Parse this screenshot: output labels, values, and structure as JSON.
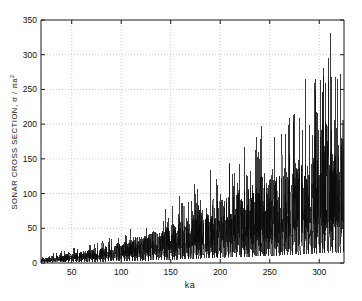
{
  "figure": {
    "background_color": "#ffffff",
    "axes_color": "#1a1a1a",
    "grid_color": "#b4b4b4",
    "data_color": "#0a0a0a"
  },
  "chart_data": {
    "type": "line",
    "title": "",
    "subtitle": "",
    "xlabel": "ka",
    "ylabel": "SONAR CROSS SECTION, σ / πa",
    "ylabel_exponent": "2",
    "ylabel_plain": "SONAR CROSS SECTION, σ / πa²",
    "xlim": [
      19,
      325
    ],
    "ylim": [
      0,
      350
    ],
    "xticks": [
      50,
      100,
      150,
      200,
      250,
      300
    ],
    "xtick_labels": [
      "50",
      "100",
      "150",
      "200",
      "250",
      "300"
    ],
    "yticks": [
      0,
      50,
      100,
      150,
      200,
      250,
      300,
      350
    ],
    "ytick_labels": [
      "0",
      "50",
      "100",
      "150",
      "200",
      "250",
      "300",
      "350"
    ],
    "grid": true,
    "grid_style": "dotted",
    "legend": null,
    "legend_position": "none",
    "annotations": [],
    "series": [
      {
        "name": "sonar cross section",
        "description": "Dense resonance spike spectrum; amplitude envelope grows roughly linearly with ka, with sharp narrow resonance peaks riding on a lower broadband floor.",
        "envelope_x": [
          20,
          40,
          60,
          80,
          100,
          120,
          140,
          160,
          180,
          200,
          220,
          240,
          260,
          280,
          300,
          320
        ],
        "envelope_peak_y": [
          9,
          18,
          26,
          33,
          44,
          58,
          72,
          100,
          122,
          152,
          160,
          200,
          190,
          255,
          295,
          332
        ],
        "envelope_floor_y": [
          4,
          7,
          10,
          13,
          17,
          22,
          27,
          34,
          42,
          50,
          56,
          64,
          70,
          80,
          92,
          100
        ],
        "max_value": 332,
        "max_value_x": 311,
        "min_value": 0,
        "n_points": 3050
      }
    ]
  },
  "axis_geometry": {
    "left": 41,
    "right": 344,
    "top": 20,
    "bottom": 263
  }
}
